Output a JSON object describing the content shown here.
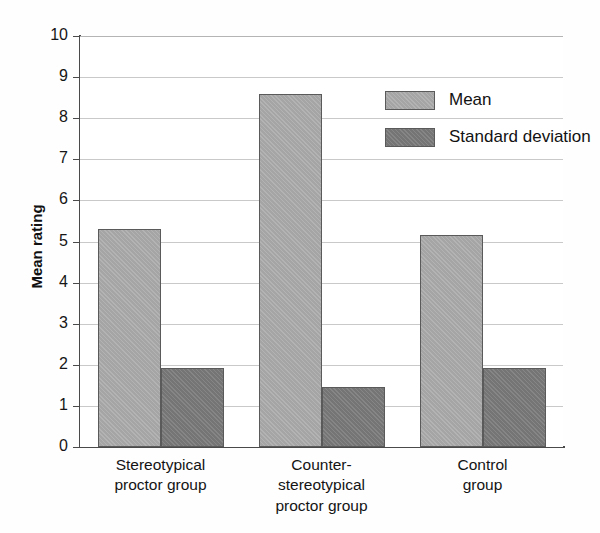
{
  "chart_data": {
    "type": "bar",
    "title": "",
    "xlabel": "",
    "ylabel": "Mean rating",
    "ylim": [
      0,
      10
    ],
    "ytick_labels": [
      "10",
      "9",
      "8",
      "7",
      "6",
      "5",
      "4",
      "3",
      "2",
      "1",
      "0"
    ],
    "grid": true,
    "legend_position": "upper-right-inside",
    "categories": [
      "Stereotypical\nproctor group",
      "Counter-\nstereotypical\nproctor group",
      "Control\ngroup"
    ],
    "series": [
      {
        "name": "Mean",
        "color": "#a5a5a5",
        "values": [
          5.3,
          8.6,
          5.15
        ]
      },
      {
        "name": "Standard deviation",
        "color": "#757575",
        "values": [
          1.93,
          1.45,
          1.93
        ]
      }
    ]
  },
  "legend": {
    "items": [
      {
        "label": "Mean",
        "color": "#a5a5a5"
      },
      {
        "label": "Standard deviation",
        "color": "#757575"
      }
    ]
  },
  "axes": {
    "y_title": "Mean rating"
  }
}
